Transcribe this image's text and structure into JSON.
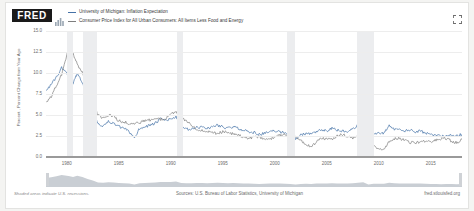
{
  "header": {
    "brand": "FRED",
    "spark_icon": "mini-chart-icon",
    "expand_icon": "fullscreen-icon"
  },
  "legend": [
    {
      "label": "University of Michigan: Inflation Expectation",
      "color": "#4572a7",
      "swatch_icon": "line-swatch-icon"
    },
    {
      "label": "Consumer Price Index for All Urban Consumers: All Items Less Food and Energy",
      "color": "#7e7e7e",
      "swatch_icon": "line-swatch-icon"
    }
  ],
  "footer": {
    "note": "Shaded areas indicate U.S. recessions.",
    "sources": "Sources: U.S. Bureau of Labor Statistics, University of Michigan",
    "url": "fred.stlouisfed.org"
  },
  "chart_data": {
    "type": "line",
    "title": "",
    "xlabel": "",
    "ylabel": "Percent , Percent Change from Year Ago",
    "ylim": [
      0,
      15
    ],
    "yticks": [
      "15.0",
      "12.5",
      "10.0",
      "7.5",
      "5.0",
      "2.5",
      "0.0"
    ],
    "xlim": [
      1978,
      2018
    ],
    "xticks": [
      "1980",
      "1985",
      "1990",
      "1995",
      "2000",
      "2005",
      "2010",
      "2015"
    ],
    "grid": true,
    "legend_position": "top",
    "recessions": [
      {
        "start": 1980.0,
        "end": 1980.6
      },
      {
        "start": 1981.6,
        "end": 1982.9
      },
      {
        "start": 1990.6,
        "end": 1991.2
      },
      {
        "start": 2001.2,
        "end": 2001.9
      },
      {
        "start": 2007.9,
        "end": 2009.5
      }
    ],
    "series": [
      {
        "name": "University of Michigan: Inflation Expectation",
        "color": "#4572a7",
        "x": [
          1978.0,
          1978.5,
          1979.0,
          1979.5,
          1980.0,
          1980.3,
          1980.6,
          1981.0,
          1981.5,
          1982.0,
          1982.5,
          1983.0,
          1983.5,
          1984.0,
          1984.5,
          1985.0,
          1985.5,
          1986.0,
          1986.5,
          1987.0,
          1987.5,
          1988.0,
          1988.5,
          1989.0,
          1989.5,
          1990.0,
          1990.5,
          1991.0,
          1991.5,
          1992.0,
          1992.5,
          1993.0,
          1993.5,
          1994.0,
          1994.5,
          1995.0,
          1995.5,
          1996.0,
          1996.5,
          1997.0,
          1997.5,
          1998.0,
          1998.5,
          1999.0,
          1999.5,
          2000.0,
          2000.5,
          2001.0,
          2001.5,
          2002.0,
          2002.5,
          2003.0,
          2003.5,
          2004.0,
          2004.5,
          2005.0,
          2005.5,
          2006.0,
          2006.5,
          2007.0,
          2007.5,
          2008.0,
          2008.5,
          2009.0,
          2009.5,
          2010.0,
          2010.5,
          2011.0,
          2011.5,
          2012.0,
          2012.5,
          2013.0,
          2013.5,
          2014.0,
          2014.5,
          2015.0,
          2015.5,
          2016.0,
          2016.5,
          2017.0,
          2017.5,
          2018.0
        ],
        "values": [
          8.0,
          8.6,
          9.5,
          10.6,
          10.0,
          9.4,
          8.8,
          9.9,
          8.8,
          7.0,
          5.8,
          4.0,
          3.7,
          4.2,
          4.0,
          3.6,
          3.4,
          3.0,
          2.3,
          3.4,
          3.6,
          3.8,
          4.0,
          4.5,
          4.4,
          4.5,
          4.8,
          3.6,
          3.3,
          3.3,
          3.5,
          3.6,
          3.4,
          3.6,
          3.8,
          3.6,
          3.4,
          3.6,
          3.4,
          3.2,
          3.0,
          2.9,
          2.7,
          2.8,
          3.0,
          3.1,
          3.0,
          2.9,
          2.7,
          2.2,
          2.6,
          2.8,
          2.7,
          3.0,
          3.2,
          3.1,
          3.4,
          3.2,
          3.1,
          3.0,
          3.3,
          3.8,
          4.2,
          2.2,
          2.8,
          2.9,
          2.8,
          3.8,
          3.3,
          3.2,
          3.1,
          3.2,
          3.0,
          3.1,
          2.8,
          2.7,
          2.6,
          2.5,
          2.6,
          2.6,
          2.5,
          2.7
        ]
      },
      {
        "name": "Consumer Price Index for All Urban Consumers: All Items Less Food and Energy",
        "color": "#7e7e7e",
        "x": [
          1978.0,
          1978.5,
          1979.0,
          1979.5,
          1980.0,
          1980.3,
          1980.6,
          1981.0,
          1981.5,
          1982.0,
          1982.5,
          1983.0,
          1983.5,
          1984.0,
          1984.5,
          1985.0,
          1985.5,
          1986.0,
          1986.5,
          1987.0,
          1987.5,
          1988.0,
          1988.5,
          1989.0,
          1989.5,
          1990.0,
          1990.5,
          1991.0,
          1991.5,
          1992.0,
          1992.5,
          1993.0,
          1993.5,
          1994.0,
          1994.5,
          1995.0,
          1995.5,
          1996.0,
          1996.5,
          1997.0,
          1997.5,
          1998.0,
          1998.5,
          1999.0,
          1999.5,
          2000.0,
          2000.5,
          2001.0,
          2001.5,
          2002.0,
          2002.5,
          2003.0,
          2003.5,
          2004.0,
          2004.5,
          2005.0,
          2005.5,
          2006.0,
          2006.5,
          2007.0,
          2007.5,
          2008.0,
          2008.5,
          2009.0,
          2009.5,
          2010.0,
          2010.5,
          2011.0,
          2011.5,
          2012.0,
          2012.5,
          2013.0,
          2013.5,
          2014.0,
          2014.5,
          2015.0,
          2015.5,
          2016.0,
          2016.5,
          2017.0,
          2017.5,
          2018.0
        ],
        "values": [
          6.4,
          7.2,
          8.5,
          9.8,
          12.2,
          13.0,
          12.4,
          11.0,
          10.1,
          8.0,
          6.6,
          5.0,
          4.6,
          5.0,
          4.8,
          4.3,
          4.2,
          4.0,
          3.9,
          4.1,
          4.3,
          4.4,
          4.6,
          4.5,
          4.6,
          5.2,
          5.3,
          4.7,
          4.3,
          3.8,
          3.3,
          3.2,
          3.1,
          2.9,
          2.8,
          3.0,
          3.0,
          2.7,
          2.6,
          2.4,
          2.2,
          2.4,
          2.4,
          2.1,
          2.0,
          2.4,
          2.6,
          2.7,
          2.6,
          2.4,
          2.0,
          1.5,
          1.2,
          1.8,
          2.2,
          2.2,
          2.1,
          2.5,
          2.7,
          2.4,
          2.3,
          2.4,
          2.5,
          1.7,
          1.5,
          0.9,
          1.0,
          1.8,
          2.2,
          2.2,
          2.0,
          1.7,
          1.7,
          1.8,
          1.8,
          1.8,
          2.0,
          2.2,
          2.2,
          1.9,
          1.7,
          2.1
        ]
      }
    ],
    "navigator": {
      "label": "range-navigator",
      "handle_positions": [
        0,
        1
      ]
    }
  }
}
